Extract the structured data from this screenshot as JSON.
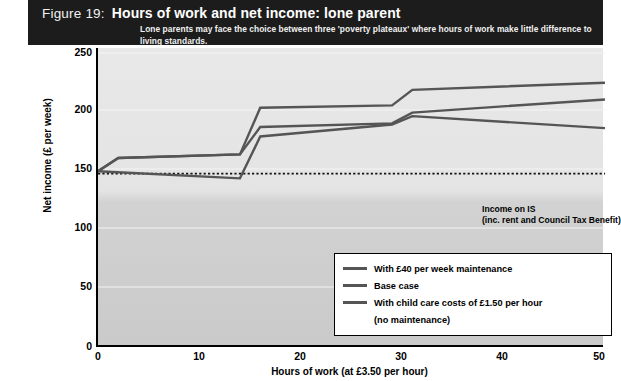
{
  "header": {
    "figure_label": "Figure 19:",
    "title": "Hours of work and net income: lone parent",
    "subtitle": "Lone parents may face the choice between three 'poverty plateaux' where hours of work make little difference to living standards."
  },
  "annotation": {
    "line1": "Income on IS",
    "line2": "(inc. rent and Council Tax Benefit)"
  },
  "legend": {
    "items": [
      {
        "label": "With £40 per week maintenance",
        "color": "#555555"
      },
      {
        "label": "Base case",
        "color": "#555555"
      },
      {
        "label": "With child care costs of £1.50 per hour",
        "color": "#555555"
      },
      {
        "label": "(no maintenance)",
        "color": ""
      }
    ]
  },
  "chart_data": {
    "type": "line",
    "title": "Hours of work and net income: lone parent",
    "xlabel": "Hours of work (at £3.50 per hour)",
    "ylabel": "Net income (£ per week)",
    "xlim": [
      0,
      50
    ],
    "ylim": [
      0,
      250
    ],
    "xticks": [
      0,
      10,
      20,
      30,
      40,
      50
    ],
    "yticks": [
      0,
      50,
      100,
      150,
      200,
      250
    ],
    "grid": false,
    "legend_position": "lower right",
    "annotations": [
      {
        "text": "Income on IS (inc. rent and Council Tax Benefit)",
        "type": "hline",
        "y": 145,
        "style": "dotted"
      }
    ],
    "series": [
      {
        "name": "With £40 per week maintenance",
        "color": "#555555",
        "x": [
          0,
          2,
          14,
          16,
          29,
          31,
          50
        ],
        "values": [
          147,
          158,
          161,
          200,
          202,
          215,
          221
        ]
      },
      {
        "name": "Base case",
        "color": "#555555",
        "x": [
          0,
          2,
          14,
          16,
          29,
          31,
          50
        ],
        "values": [
          147,
          158,
          161,
          184,
          187,
          196,
          207
        ]
      },
      {
        "name": "With child care costs of £1.50 per hour (no maintenance)",
        "color": "#555555",
        "x": [
          0,
          14,
          16,
          29,
          31,
          50
        ],
        "values": [
          147,
          141,
          176,
          186,
          193,
          183
        ]
      }
    ]
  },
  "axes": {
    "y_tick_labels": [
      "250",
      "200",
      "150",
      "100",
      "50",
      "0"
    ],
    "x_tick_labels": [
      "0",
      "10",
      "20",
      "30",
      "40",
      "50"
    ],
    "x_axis_title": "Hours of work (at £3.50 per hour)",
    "y_axis_title": "Net income (£ per week)",
    "origin_label": "0"
  }
}
